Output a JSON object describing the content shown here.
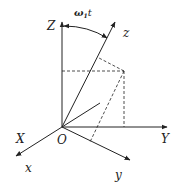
{
  "diagram": {
    "type": "3d-coordinate-frames",
    "fixed_frame": {
      "axes": [
        {
          "name": "Z",
          "label": "Z"
        },
        {
          "name": "Y",
          "label": "Y"
        },
        {
          "name": "X",
          "label": "X"
        }
      ]
    },
    "rotating_frame": {
      "axes": [
        {
          "name": "z",
          "label": "z"
        },
        {
          "name": "y",
          "label": "y"
        },
        {
          "name": "x",
          "label": "x"
        }
      ]
    },
    "origin_label": "O",
    "angle_label_main": "ω",
    "angle_label_sub": "1",
    "angle_label_t": "t",
    "colors": {
      "line": "#222222",
      "background": "#ffffff"
    }
  }
}
